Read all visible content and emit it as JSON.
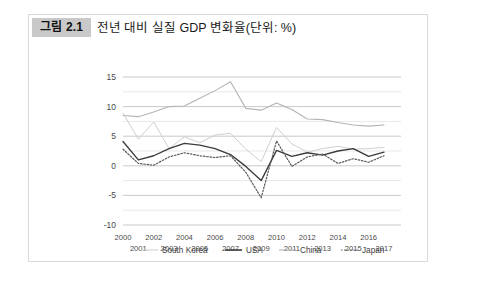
{
  "figure": {
    "badge": "그림 2.1",
    "title": "전년 대비 실질 GDP 변화율(단위: %)"
  },
  "chart_data": {
    "type": "line",
    "title": "전년 대비 실질 GDP 변화율(단위: %)",
    "xlabel": "",
    "ylabel": "",
    "ylim": [
      -10,
      15
    ],
    "xlim": [
      2000,
      2017
    ],
    "yticks": [
      15,
      10,
      5,
      0,
      -5,
      -10
    ],
    "ytick_labels": [
      "15",
      "10",
      "5",
      "0",
      "-5",
      "-10"
    ],
    "minor_gridlines": true,
    "grid": true,
    "legend_position": "bottom",
    "x": [
      2000,
      2001,
      2002,
      2003,
      2004,
      2005,
      2006,
      2007,
      2008,
      2009,
      2010,
      2011,
      2012,
      2013,
      2014,
      2015,
      2016,
      2017
    ],
    "xtick_labels_top": [
      "2000",
      "",
      "2002",
      "",
      "2004",
      "",
      "2006",
      "",
      "2008",
      "",
      "2010",
      "",
      "2012",
      "",
      "2014",
      "",
      "2016",
      ""
    ],
    "xtick_labels_bottom": [
      "",
      "2001",
      "",
      "2003",
      "",
      "2005",
      "",
      "2007",
      "",
      "2009",
      "",
      "2011",
      "",
      "2013",
      "",
      "2015",
      "",
      "2017"
    ],
    "series": [
      {
        "name": "South Korea",
        "color": "#cfcfcf",
        "style": "solid",
        "width": 1.0,
        "values": [
          8.9,
          4.5,
          7.4,
          2.9,
          4.9,
          3.9,
          5.2,
          5.5,
          2.8,
          0.7,
          6.5,
          3.7,
          2.3,
          2.9,
          3.3,
          2.8,
          2.9,
          3.1
        ]
      },
      {
        "name": "USA",
        "color": "#3b3b3b",
        "style": "solid",
        "width": 1.35,
        "values": [
          4.1,
          1.0,
          1.7,
          2.9,
          3.8,
          3.5,
          2.9,
          1.9,
          -0.1,
          -2.5,
          2.6,
          1.6,
          2.2,
          1.8,
          2.5,
          2.9,
          1.6,
          2.3
        ]
      },
      {
        "name": "China",
        "color": "#b4b4b4",
        "style": "solid",
        "width": 1.1,
        "values": [
          8.5,
          8.3,
          9.1,
          10.0,
          10.1,
          11.4,
          12.7,
          14.2,
          9.7,
          9.4,
          10.6,
          9.5,
          7.9,
          7.8,
          7.3,
          6.9,
          6.7,
          6.9
        ]
      },
      {
        "name": "Japan",
        "color": "#5a5a5a",
        "style": "dotted",
        "width": 1.2,
        "values": [
          2.8,
          0.4,
          0.1,
          1.5,
          2.2,
          1.7,
          1.4,
          1.7,
          -1.1,
          -5.4,
          4.2,
          -0.1,
          1.5,
          2.0,
          0.4,
          1.2,
          0.6,
          1.7
        ]
      }
    ]
  },
  "legend": {
    "items": [
      {
        "label": "South Korea",
        "color": "#cfcfcf",
        "style": "solid"
      },
      {
        "label": "USA",
        "color": "#3b3b3b",
        "style": "solid"
      },
      {
        "label": "China",
        "color": "#b4b4b4",
        "style": "solid"
      },
      {
        "label": "Japan",
        "color": "#5a5a5a",
        "style": "dotted"
      }
    ]
  }
}
